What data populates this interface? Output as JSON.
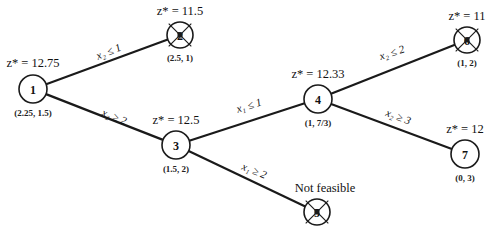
{
  "diagram": {
    "type": "branch-and-bound-tree",
    "nodes": [
      {
        "id": "1",
        "label": "1",
        "z": "z* = 12.75",
        "solution": "(2.25, 1.5)",
        "status": "branched"
      },
      {
        "id": "2",
        "label": "2",
        "z": "z* = 11.5",
        "solution": "(2.5, 1)",
        "status": "fathomed"
      },
      {
        "id": "3",
        "label": "3",
        "z": "z* = 12.5",
        "solution": "(1.5, 2)",
        "status": "branched"
      },
      {
        "id": "4",
        "label": "4",
        "z": "z* = 12.33",
        "solution": "(1, 7/3)",
        "status": "branched"
      },
      {
        "id": "5",
        "label": "5",
        "z": "",
        "solution": "",
        "note": "Not feasible",
        "status": "fathomed"
      },
      {
        "id": "6",
        "label": "6",
        "z": "z* = 11",
        "solution": "(1, 2)",
        "status": "fathomed"
      },
      {
        "id": "7",
        "label": "7",
        "z": "z* = 12",
        "solution": "(0, 3)",
        "status": "active"
      }
    ],
    "edges": [
      {
        "from": "1",
        "to": "2",
        "label": "x₂ ≤ 1"
      },
      {
        "from": "1",
        "to": "3",
        "label": "x₂ ≥ 2"
      },
      {
        "from": "3",
        "to": "4",
        "label": "x₁ ≤ 1"
      },
      {
        "from": "3",
        "to": "5",
        "label": "x₁ ≥ 2"
      },
      {
        "from": "4",
        "to": "6",
        "label": "x₂ ≤ 2"
      },
      {
        "from": "4",
        "to": "7",
        "label": "x₂ ≥ 3"
      }
    ]
  }
}
